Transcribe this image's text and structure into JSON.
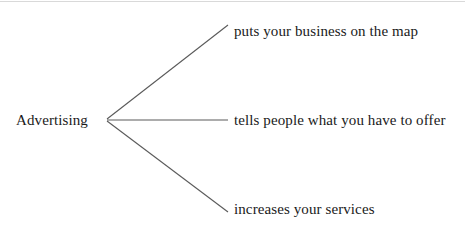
{
  "diagram": {
    "type": "concept-map",
    "root": {
      "label": "Advertising",
      "x": 107,
      "y": 120
    },
    "branches": [
      {
        "label": "puts your business on the map",
        "line_end_x": 228,
        "line_end_y": 25
      },
      {
        "label": "tells people what you have to offer",
        "line_end_x": 228,
        "line_end_y": 120
      },
      {
        "label": "increases your services",
        "line_end_x": 228,
        "line_end_y": 212
      }
    ],
    "colors": {
      "background": "#ffffff",
      "line": "#5a5a5a",
      "text": "#1a1a1a",
      "top_rule": "#d9d9d9"
    }
  }
}
